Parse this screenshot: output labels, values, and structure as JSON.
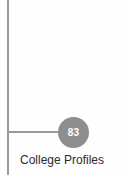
{
  "diagram": {
    "background_color": "#fefefe",
    "axis": {
      "line_color": "#9a9a9a",
      "vertical_label": "",
      "horizontal_label": ""
    },
    "node": {
      "value": "83",
      "fill_color": "#8e8e8e",
      "text_color": "#ffffff",
      "caption": "College Profiles",
      "caption_color": "#2b2b2b"
    }
  }
}
